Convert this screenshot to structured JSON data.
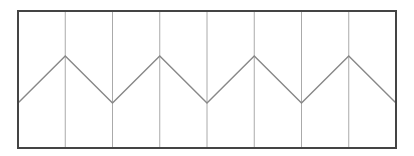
{
  "diagram": {
    "type": "zigzag-panel",
    "width": 414,
    "height": 156,
    "frame": {
      "x": 18,
      "y": 11,
      "width": 378,
      "height": 137,
      "stroke": "#444444",
      "stroke_width": 2
    },
    "dividers": {
      "count": 7,
      "x": [
        65.25,
        112.5,
        159.75,
        207,
        254.25,
        301.5,
        348.75
      ],
      "stroke": "#aaaaaa",
      "stroke_width": 1
    },
    "zigzag": {
      "stroke": "#888888",
      "stroke_width": 1.4,
      "points": [
        [
          18,
          103
        ],
        [
          65.25,
          56
        ],
        [
          112.5,
          103
        ],
        [
          159.75,
          56
        ],
        [
          207,
          103
        ],
        [
          254.25,
          56
        ],
        [
          301.5,
          103
        ],
        [
          348.75,
          56
        ],
        [
          396,
          103
        ]
      ]
    },
    "background": "#ffffff"
  }
}
